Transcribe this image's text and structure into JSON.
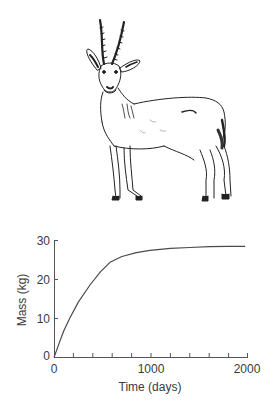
{
  "illustration": {
    "subject": "antelope",
    "description": "Line drawing of a standing antelope with ringed, lyre-shaped horns, facing the viewer"
  },
  "chart_data": {
    "type": "line",
    "title": "",
    "xlabel": "Time (days)",
    "ylabel": "Mass (kg)",
    "xlim": [
      0,
      2000
    ],
    "ylim": [
      0,
      30
    ],
    "x_ticks": [
      0,
      1000,
      2000
    ],
    "x_tick_labels": [
      "0",
      "1000",
      "2000"
    ],
    "x_minor_tick_step": 200,
    "y_ticks": [
      0,
      10,
      20,
      30
    ],
    "y_tick_labels": [
      "0",
      "10",
      "20",
      "30"
    ],
    "grid": false,
    "legend": null,
    "series": [
      {
        "name": "Mass",
        "color": "#4a4a4a",
        "x": [
          0,
          50,
          100,
          165,
          250,
          371,
          480,
          577,
          700,
          850,
          990,
          1200,
          1400,
          1600,
          1800,
          1970
        ],
        "y": [
          0,
          3.5,
          6.8,
          10.2,
          14.2,
          18.6,
          22.0,
          24.4,
          25.9,
          26.9,
          27.5,
          28.0,
          28.2,
          28.4,
          28.5,
          28.5
        ]
      }
    ]
  }
}
